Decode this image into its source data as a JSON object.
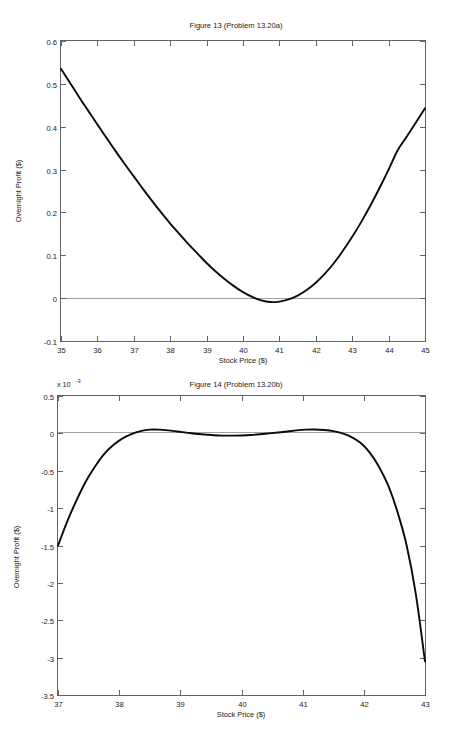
{
  "page": {
    "background_color": "#ffffff",
    "curve_color": "#0a0a0a",
    "axis_color": "#636363",
    "zero_line_color": "#8a8a8a"
  },
  "chart_data": [
    {
      "type": "line",
      "title": "Figure 13 (Problem 13.20a)",
      "xlabel": "Stock Price ($)",
      "ylabel": "Overnight Profit ($)",
      "xlim": [
        35,
        45
      ],
      "ylim": [
        -0.1,
        0.6
      ],
      "xticks": [
        35,
        36,
        37,
        38,
        39,
        40,
        41,
        42,
        43,
        44,
        45
      ],
      "xtick_labels": [
        "35",
        "36",
        "37",
        "38",
        "39",
        "40",
        "41",
        "42",
        "43",
        "44",
        "45"
      ],
      "yticks": [
        -0.1,
        0,
        0.1,
        0.2,
        0.3,
        0.4,
        0.5,
        0.6
      ],
      "ytick_labels": [
        "-0.1",
        "0",
        "0.1",
        "0.2",
        "0.3",
        "0.4",
        "0.5",
        "0.6"
      ],
      "y_multiplier": "",
      "grid": false,
      "legend": "none",
      "zero_reference_line": 0,
      "x": [
        35.0,
        35.25,
        35.5,
        35.75,
        36.0,
        36.25,
        36.5,
        36.75,
        37.0,
        37.25,
        37.5,
        37.75,
        38.0,
        38.25,
        38.5,
        38.75,
        39.0,
        39.25,
        39.5,
        39.75,
        40.0,
        40.25,
        40.5,
        40.75,
        41.0,
        41.25,
        41.5,
        41.75,
        42.0,
        42.25,
        42.5,
        42.75,
        43.0,
        43.25,
        43.5,
        43.75,
        44.0,
        44.25,
        44.5,
        44.75,
        45.0
      ],
      "y": [
        0.535,
        0.502,
        0.469,
        0.437,
        0.405,
        0.374,
        0.343,
        0.313,
        0.284,
        0.255,
        0.227,
        0.2,
        0.174,
        0.15,
        0.126,
        0.104,
        0.082,
        0.062,
        0.044,
        0.028,
        0.014,
        0.003,
        -0.005,
        -0.009,
        -0.008,
        -0.003,
        0.006,
        0.019,
        0.036,
        0.057,
        0.082,
        0.111,
        0.143,
        0.178,
        0.216,
        0.257,
        0.3,
        0.345,
        0.377,
        0.41,
        0.443
      ],
      "series_name": "Overnight Profit"
    },
    {
      "type": "line",
      "title": "Figure 14 (Problem 13.20b)",
      "xlabel": "Stock Price ($)",
      "ylabel": "Overnight Profit ($)",
      "xlim": [
        37,
        43
      ],
      "ylim": [
        -3.5,
        0.5
      ],
      "xticks": [
        37,
        38,
        39,
        40,
        41,
        42,
        43
      ],
      "xtick_labels": [
        "37",
        "38",
        "39",
        "40",
        "41",
        "42",
        "43"
      ],
      "yticks": [
        -3.5,
        -3,
        -2.5,
        -2,
        -1.5,
        -1,
        -0.5,
        0,
        0.5
      ],
      "ytick_labels": [
        "-3.5",
        "-3",
        "-2.5",
        "-2",
        "-1.5",
        "-1",
        "-0.5",
        "0",
        "0.5"
      ],
      "y_multiplier": "x 10",
      "y_multiplier_exponent": "-3",
      "grid": false,
      "legend": "none",
      "zero_reference_line": 0,
      "x": [
        37.0,
        37.15,
        37.3,
        37.45,
        37.6,
        37.75,
        37.9,
        38.05,
        38.2,
        38.35,
        38.5,
        38.65,
        38.8,
        38.95,
        39.1,
        39.25,
        39.4,
        39.55,
        39.7,
        39.85,
        40.0,
        40.15,
        40.3,
        40.45,
        40.6,
        40.75,
        40.9,
        41.05,
        41.2,
        41.35,
        41.5,
        41.65,
        41.8,
        41.95,
        42.1,
        42.25,
        42.4,
        42.55,
        42.7,
        42.85,
        43.0
      ],
      "y": [
        -1.5,
        -1.18,
        -0.9,
        -0.65,
        -0.45,
        -0.28,
        -0.16,
        -0.07,
        -0.01,
        0.03,
        0.05,
        0.05,
        0.04,
        0.025,
        0.01,
        -0.005,
        -0.015,
        -0.025,
        -0.03,
        -0.03,
        -0.028,
        -0.022,
        -0.012,
        0.0,
        0.012,
        0.025,
        0.04,
        0.05,
        0.052,
        0.045,
        0.03,
        0.0,
        -0.05,
        -0.13,
        -0.26,
        -0.45,
        -0.7,
        -1.05,
        -1.5,
        -2.15,
        -3.05
      ],
      "series_name": "Overnight Profit"
    }
  ]
}
